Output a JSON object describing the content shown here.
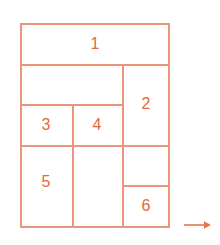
{
  "diagram": {
    "colors": {
      "line": "#e8957c",
      "label": "#e26a3c",
      "background": "#ffffff"
    },
    "outer_box": {
      "x": 20,
      "y": 23,
      "width": 150,
      "height": 203
    },
    "cells": [
      {
        "id": "cell-1",
        "label": "1",
        "x": 20,
        "y": 23,
        "width": 150,
        "height": 41,
        "cx": 95,
        "cy": 44
      },
      {
        "id": "cell-2",
        "label": "2",
        "x": 122,
        "y": 64,
        "width": 48,
        "height": 81,
        "cx": 146,
        "cy": 104
      },
      {
        "id": "cell-3",
        "label": "3",
        "x": 20,
        "y": 104,
        "width": 52,
        "height": 41,
        "cx": 46,
        "cy": 125
      },
      {
        "id": "cell-4",
        "label": "4",
        "x": 72,
        "y": 104,
        "width": 50,
        "height": 41,
        "cx": 97,
        "cy": 125
      },
      {
        "id": "cell-5",
        "label": "5",
        "x": 20,
        "y": 145,
        "width": 52,
        "height": 81,
        "cx": 46,
        "cy": 182
      },
      {
        "id": "cell-6",
        "label": "6",
        "x": 122,
        "y": 185,
        "width": 48,
        "height": 41,
        "cx": 146,
        "cy": 206
      },
      {
        "id": "cell-blank-top",
        "label": "",
        "x": 20,
        "y": 64,
        "width": 102,
        "height": 40,
        "cx": 71,
        "cy": 84
      },
      {
        "id": "cell-blank-middle",
        "label": "",
        "x": 72,
        "y": 145,
        "width": 50,
        "height": 81,
        "cx": 97,
        "cy": 185
      },
      {
        "id": "cell-blank-right",
        "label": "",
        "x": 122,
        "y": 145,
        "width": 48,
        "height": 40,
        "cx": 146,
        "cy": 165
      }
    ],
    "h_lines": [
      {
        "name": "outer-top-edge",
        "x": 20,
        "y": 23,
        "length": 150
      },
      {
        "name": "divider-below-cell-1",
        "x": 20,
        "y": 64,
        "length": 150
      },
      {
        "name": "divider-above-cell-3",
        "x": 20,
        "y": 104,
        "length": 102
      },
      {
        "name": "divider-below-cell-3",
        "x": 20,
        "y": 145,
        "length": 150
      },
      {
        "name": "divider-above-cell-6",
        "x": 122,
        "y": 185,
        "length": 48
      },
      {
        "name": "outer-bottom-edge",
        "x": 20,
        "y": 226,
        "length": 150
      }
    ],
    "v_lines": [
      {
        "name": "outer-left-edge",
        "x": 20,
        "y": 23,
        "length": 203
      },
      {
        "name": "divider-between-3-and-4",
        "x": 72,
        "y": 104,
        "length": 122
      },
      {
        "name": "divider-left-of-column-2-6",
        "x": 122,
        "y": 64,
        "length": 162
      },
      {
        "name": "outer-right-edge",
        "x": 170,
        "y": 23,
        "length": 203
      }
    ],
    "arrow": {
      "name": "right-arrow",
      "direction": "right",
      "x": 183,
      "y": 218,
      "width": 29,
      "height": 14,
      "color": "#e2784f"
    }
  }
}
